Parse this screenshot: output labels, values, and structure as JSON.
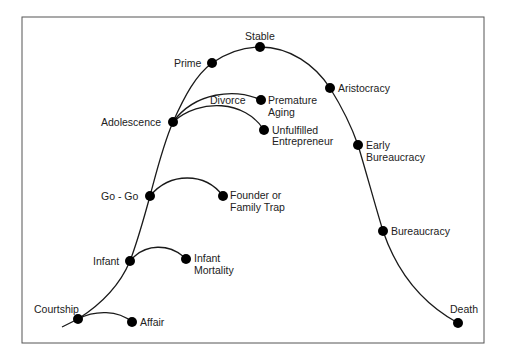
{
  "diagram": {
    "title": "",
    "frame": {
      "x": 22,
      "y": 17,
      "w": 462,
      "h": 326
    },
    "colors": {
      "line": "#1a1a1a",
      "node": "#000000",
      "frame": "#555555",
      "text": "#222222"
    },
    "stages": [
      {
        "id": "courtship",
        "label": "Courtship",
        "x": 78,
        "y": 319
      },
      {
        "id": "infant",
        "label": "Infant",
        "x": 130,
        "y": 261
      },
      {
        "id": "gogo",
        "label": "Go - Go",
        "x": 150,
        "y": 196
      },
      {
        "id": "adolescence",
        "label": "Adolescence",
        "x": 173,
        "y": 122
      },
      {
        "id": "prime",
        "label": "Prime",
        "x": 212,
        "y": 63
      },
      {
        "id": "stable",
        "label": "Stable",
        "x": 260,
        "y": 47
      },
      {
        "id": "aristocracy",
        "label": "Aristocracy",
        "x": 330,
        "y": 88
      },
      {
        "id": "early_bureaucracy",
        "label_lines": [
          "Early",
          "Bureaucracy"
        ],
        "x": 358,
        "y": 145
      },
      {
        "id": "bureaucracy",
        "label": "Bureaucracy",
        "x": 383,
        "y": 231
      },
      {
        "id": "death",
        "label": "Death",
        "x": 458,
        "y": 323
      }
    ],
    "branches": [
      {
        "from": "courtship",
        "id": "affair",
        "label_lines": [
          "Affair"
        ],
        "x": 132,
        "y": 322
      },
      {
        "from": "infant",
        "id": "infant_mortality",
        "label_lines": [
          "Infant",
          "Mortality"
        ],
        "x": 186,
        "y": 259
      },
      {
        "from": "gogo",
        "id": "founder_trap",
        "label_lines": [
          "Founder or",
          "Family Trap"
        ],
        "x": 223,
        "y": 196
      },
      {
        "from": "adolescence",
        "id": "premature_aging",
        "label_lines": [
          "Premature",
          "Aging"
        ],
        "x": 261,
        "y": 100,
        "edge_label": "Divorce"
      },
      {
        "from": "adolescence",
        "id": "unfulfilled",
        "label_lines": [
          "Unfulfilled",
          "Entrepreneur"
        ],
        "x": 264,
        "y": 130
      }
    ]
  }
}
